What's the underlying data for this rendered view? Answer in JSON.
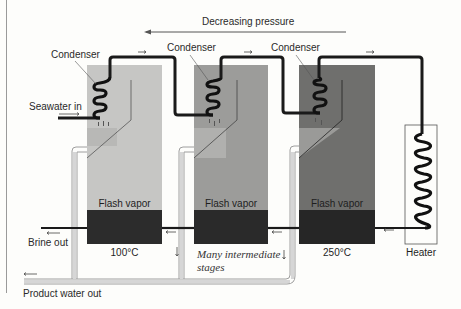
{
  "diagram": {
    "title_arrow_label": "Decreasing pressure",
    "inlet_label": "Seawater in",
    "brine_label": "Brine out",
    "product_label": "Product water out",
    "heater_label": "Heater",
    "intermediate_label_line1": "Many intermediate",
    "intermediate_label_line2": "stages",
    "stages": [
      {
        "condenser_label": "Condenser",
        "vapor_label": "Flash vapor",
        "temperature": "100°C",
        "fill": "#c4c4c4"
      },
      {
        "condenser_label": "Condenser",
        "vapor_label": "Flash vapor",
        "temperature": "",
        "fill": "#9a9a9a"
      },
      {
        "condenser_label": "Condenser",
        "vapor_label": "Flash vapor",
        "temperature": "250°C",
        "fill": "#6e6e6e"
      }
    ],
    "colors": {
      "brine": "#2b2b2b",
      "pipe": "#1a1a1a",
      "product_pipe": "#bdbdbd",
      "background": "#fdfdfb"
    }
  }
}
